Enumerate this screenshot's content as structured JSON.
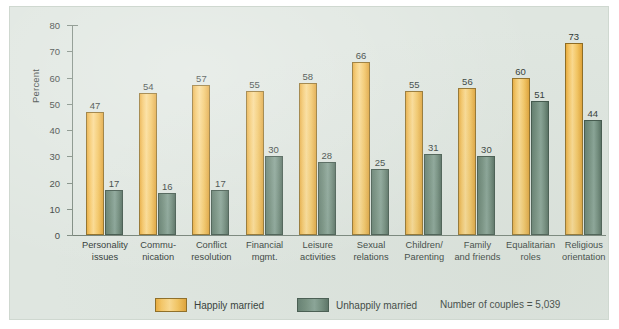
{
  "chart_data": {
    "type": "bar",
    "title": "",
    "subtitle": "",
    "xlabel": "",
    "ylabel": "Percent",
    "ylim": [
      0,
      80
    ],
    "yticks": [
      0,
      10,
      20,
      30,
      40,
      50,
      60,
      70,
      80
    ],
    "grid": false,
    "legend_position": "bottom",
    "annotation": "Number of couples = 5,039",
    "categories": [
      "Personality issues",
      "Commu-nication",
      "Conflict resolution",
      "Financial mgmt.",
      "Leisure activities",
      "Sexual relations",
      "Children/ Parenting",
      "Family and friends",
      "Equalitarian roles",
      "Religious orientation"
    ],
    "category_lines": [
      [
        "Personality",
        "issues"
      ],
      [
        "Commu-",
        "nication"
      ],
      [
        "Conflict",
        "resolution"
      ],
      [
        "Financial",
        "mgmt."
      ],
      [
        "Leisure",
        "activities"
      ],
      [
        "Sexual",
        "relations"
      ],
      [
        "Children/",
        "Parenting"
      ],
      [
        "Family",
        "and friends"
      ],
      [
        "Equalitarian",
        "roles"
      ],
      [
        "Religious",
        "orientation"
      ]
    ],
    "series": [
      {
        "name": "Happily married",
        "color": "#f2c25c",
        "values": [
          47,
          54,
          57,
          55,
          58,
          66,
          55,
          56,
          60,
          73
        ]
      },
      {
        "name": "Unhappily married",
        "color": "#6a8676",
        "values": [
          17,
          16,
          17,
          30,
          28,
          25,
          31,
          30,
          51,
          44
        ]
      }
    ]
  },
  "axis": {
    "y_title": "Percent",
    "y_tick_labels": [
      "80",
      "70",
      "60",
      "50",
      "40",
      "30",
      "20",
      "10",
      "0"
    ]
  },
  "legend": {
    "items": [
      {
        "label": "Happily married",
        "swatch": "happy-swatch"
      },
      {
        "label": "Unhappily married",
        "swatch": "unhappy-swatch"
      }
    ],
    "note": "Number of couples = 5,039"
  },
  "colors": {
    "panel_background": "#dfe6e0",
    "happily_married": "#f2c25c",
    "unhappily_married": "#6a8676",
    "axis": "#7d8a80",
    "text": "#2e3633"
  }
}
